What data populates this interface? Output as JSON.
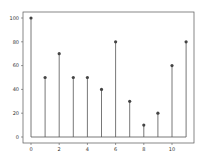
{
  "chart_data": {
    "type": "stem",
    "title": "",
    "xlabel": "",
    "ylabel": "",
    "x": [
      0,
      1,
      2,
      3,
      4,
      5,
      6,
      7,
      8,
      9,
      10,
      11
    ],
    "values": [
      100,
      50,
      70,
      50,
      50,
      40,
      80,
      30,
      10,
      20,
      60,
      80
    ],
    "baseline": 0,
    "xlim": [
      -0.6,
      11.6
    ],
    "ylim": [
      -5,
      105
    ],
    "xticks": [
      0,
      2,
      4,
      6,
      8,
      10
    ],
    "yticks": [
      0,
      20,
      40,
      60,
      80,
      100
    ],
    "grid": false,
    "legend": null,
    "colors": {
      "stem": "#555555",
      "marker": "#444444",
      "baseline": "#555555",
      "frame": "#555555"
    }
  }
}
